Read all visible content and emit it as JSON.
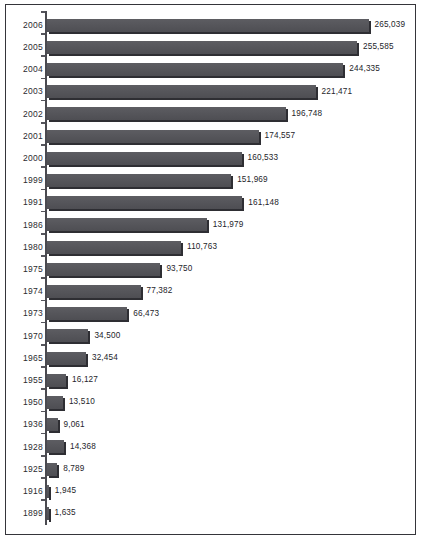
{
  "chart_data": {
    "type": "bar",
    "orientation": "horizontal",
    "title": "",
    "subtitle": "",
    "xlabel": "",
    "ylabel": "",
    "grid": false,
    "legend": null,
    "xlim": [
      0,
      265039
    ],
    "axis_range_note": "value axis unlabeled; bars scaled to maximum 265,039",
    "categories": [
      "2006",
      "2005",
      "2004",
      "2003",
      "2002",
      "2001",
      "2000",
      "1999",
      "1991",
      "1986",
      "1980",
      "1975",
      "1974",
      "1973",
      "1970",
      "1965",
      "1955",
      "1950",
      "1936",
      "1928",
      "1925",
      "1916",
      "1899"
    ],
    "values": [
      265039,
      255585,
      244335,
      221471,
      196748,
      174557,
      160533,
      151969,
      161148,
      131979,
      110763,
      93750,
      77382,
      66473,
      34500,
      32454,
      16127,
      13510,
      9061,
      14368,
      8789,
      1945,
      1635
    ],
    "value_labels": [
      "265,039",
      "255,585",
      "244,335",
      "221,471",
      "196,748",
      "174,557",
      "160,533",
      "151,969",
      "161,148",
      "131,979",
      "110,763",
      "93,750",
      "77,382",
      "66,473",
      "34,500",
      "32,454",
      "16,127",
      "13,510",
      "9,061",
      "14,368",
      "8,789",
      "1,945",
      "1,635"
    ],
    "series": [
      {
        "name": "",
        "values": [
          265039,
          255585,
          244335,
          221471,
          196748,
          174557,
          160533,
          151969,
          161148,
          131979,
          110763,
          93750,
          77382,
          66473,
          34500,
          32454,
          16127,
          13510,
          9061,
          14368,
          8789,
          1945,
          1635
        ]
      }
    ],
    "colors": {
      "bar_fill": "#56565b",
      "bar_shadow": "#2e2e33",
      "axis": "#4a4a50",
      "frame": "#35353a",
      "text": "#24242a",
      "background": "#ffffff"
    }
  }
}
